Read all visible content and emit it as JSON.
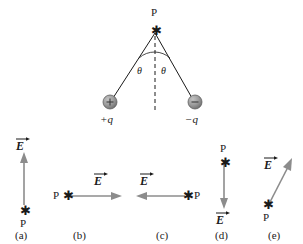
{
  "figure": {
    "background_color": "#ffffff",
    "ink_color": "#1a1a1a",
    "arrow_color": "#8c8c8c",
    "sphere_color": "#9a9a9a",
    "top_diagram": {
      "point_label": "P",
      "point_marker": "asterisk-star-marker",
      "dashed_axis": "vertical-dashed-line",
      "angle_left_label": "θ",
      "angle_right_label": "θ",
      "charges": [
        {
          "id": "positive-charge",
          "sign": "+",
          "label": "+q"
        },
        {
          "id": "negative-charge",
          "sign": "−",
          "label": "−q"
        }
      ]
    },
    "options": [
      {
        "key": "a",
        "label": "(a)",
        "point_label": "P",
        "field_label": "E",
        "direction": "up",
        "direction_degrees": 90
      },
      {
        "key": "b",
        "label": "(b)",
        "point_label": "P",
        "field_label": "E",
        "direction": "right",
        "direction_degrees": 0
      },
      {
        "key": "c",
        "label": "(c)",
        "point_label": "P",
        "field_label": "E",
        "direction": "left",
        "direction_degrees": 180
      },
      {
        "key": "d",
        "label": "(d)",
        "point_label": "P",
        "field_label": "E",
        "direction": "down",
        "direction_degrees": 270
      },
      {
        "key": "e",
        "label": "(e)",
        "point_label": "P",
        "field_label": "E",
        "direction": "up-right",
        "direction_degrees": 62
      }
    ]
  }
}
